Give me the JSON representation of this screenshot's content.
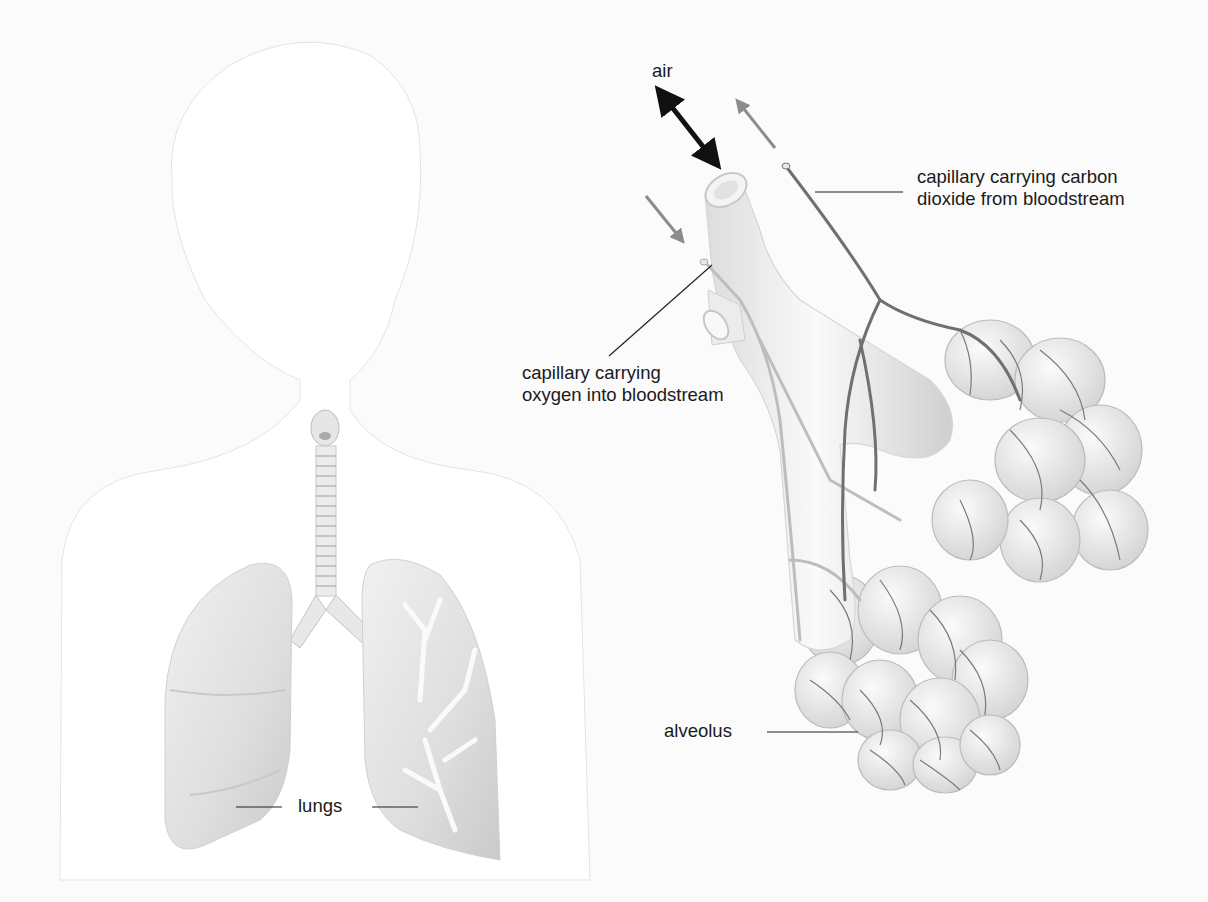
{
  "diagram": {
    "type": "anatomical-illustration",
    "panels": [
      {
        "name": "body",
        "description": "child silhouette with trachea, bronchi and lungs"
      },
      {
        "name": "alveoli-detail",
        "description": "enlarged bronchiole ending in alveolar sacs with capillary network"
      }
    ]
  },
  "labels": {
    "air": "air",
    "co2_capillary": {
      "line1": "capillary carrying carbon",
      "line2": "dioxide from bloodstream"
    },
    "o2_capillary": {
      "line1": "capillary carrying",
      "line2": "oxygen into bloodstream"
    },
    "alveolus": "alveolus",
    "lungs": "lungs"
  },
  "colors": {
    "background": "#fbfbfb",
    "silhouette": "#ffffff",
    "organ_fill": "#e6e6e6",
    "organ_shade": "#cfcfcf",
    "capillary_dark": "#6e6e6e",
    "capillary_light": "#bdbdbd",
    "arrow_air": "#111111",
    "arrow_gray": "#8c8c8c",
    "text": "#1a1a1a"
  }
}
